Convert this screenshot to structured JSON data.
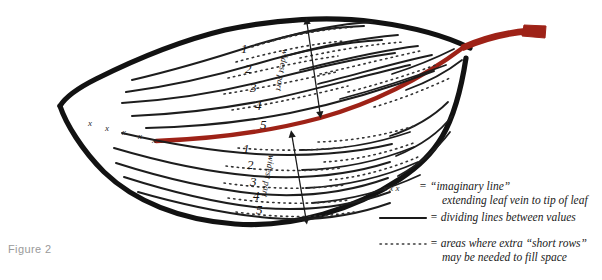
{
  "figure": {
    "caption": "Figure 2",
    "caption_color": "#9a9a9a"
  },
  "colors": {
    "outline": "#121212",
    "vein": "#1d1d1d",
    "midrib_red": "#9e2217",
    "background": "#ffffff",
    "text": "#1a1a1a"
  },
  "leaf": {
    "upper_half": {
      "vein_numbers": [
        "1",
        "2",
        "3",
        "4",
        "5"
      ],
      "widest_part_label": "widest part"
    },
    "lower_half": {
      "vein_numbers": [
        "1",
        "2",
        "3",
        "4",
        "5"
      ],
      "widest_part_label": "widest part"
    },
    "tip_marks": [
      "x",
      "x",
      "x",
      "x",
      "x"
    ]
  },
  "legend": {
    "rows": [
      {
        "sample": "x x x",
        "equals": "=",
        "line1": "“imaginary line”",
        "line2": "extending leaf vein to tip of leaf"
      },
      {
        "sample": "solid-line",
        "equals": "=",
        "line1": "dividing lines between values",
        "line2": ""
      },
      {
        "sample": "dotted-line",
        "equals": "=",
        "line1": "= areas where extra “short rows”",
        "line2": "may be needed to fill space"
      }
    ],
    "row1_sample": "x  x  x",
    "row1_eq": "=",
    "row1_l1": "“imaginary line”",
    "row1_l2": "extending leaf vein to tip of leaf",
    "row2_eq": "= dividing lines between values",
    "row3_l1": "= areas where extra “short rows”",
    "row3_l2": "may be needed to fill space"
  }
}
